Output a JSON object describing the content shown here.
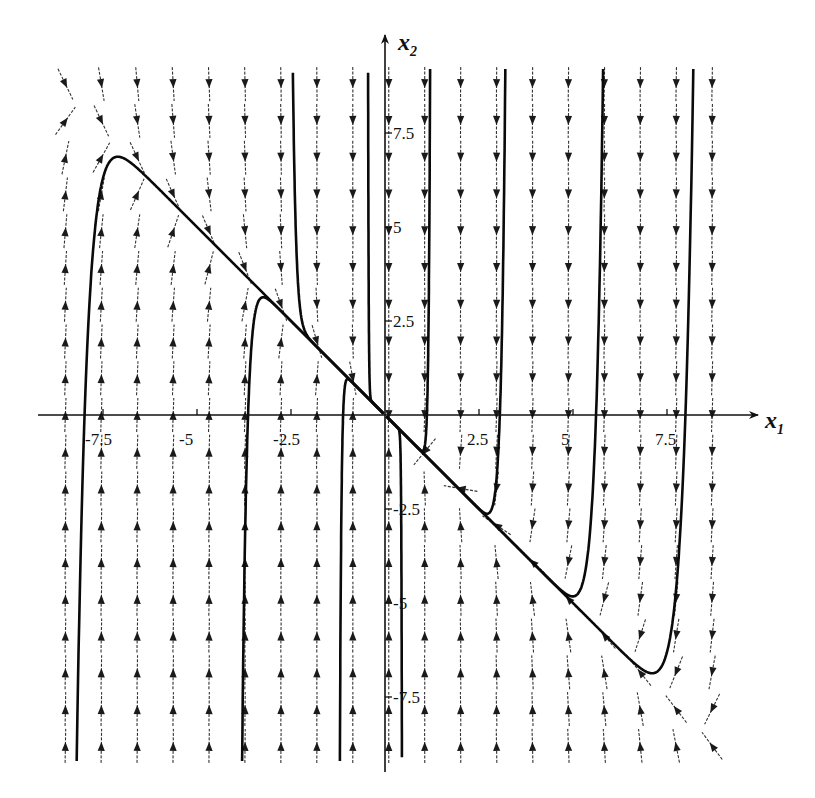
{
  "chart_data": {
    "type": "phase-portrait",
    "title": "",
    "system": {
      "description": "Linear stable node: x1' = l1*x1, x2' = -l1*x1 + l2*(x1 + x2)",
      "l1": -0.1,
      "l2": -3.0,
      "equilibrium": [
        0,
        0
      ],
      "slow_direction": [
        1,
        -1
      ],
      "fast_direction": [
        0,
        1
      ]
    },
    "xlabel": "x",
    "xlabel_sub": "1",
    "ylabel": "x",
    "ylabel_sub": "2",
    "xlim": [
      -9.2,
      9.6
    ],
    "ylim": [
      -9.5,
      10.2
    ],
    "xticks": [
      -7.5,
      -5,
      -2.5,
      2.5,
      5,
      7.5
    ],
    "xtick_labels": [
      "-7.5",
      "-5",
      "-2.5",
      "2.5",
      "5",
      "7.5"
    ],
    "yticks": [
      7.5,
      5,
      2.5,
      -2.5,
      -5,
      -7.5
    ],
    "ytick_labels": [
      "7.5",
      "5",
      "2.5",
      "-2.5",
      "-5",
      "-7.5"
    ],
    "direction_field": {
      "x1_range": [
        -8.5,
        8.7
      ],
      "x2_range": [
        -8.8,
        8.8
      ],
      "cols": 19,
      "rows": 19
    },
    "trajectories": [
      {
        "name": "traj-1",
        "start": [
          -8.2,
          -9.2
        ]
      },
      {
        "name": "traj-2",
        "start": [
          -3.8,
          -9.2
        ]
      },
      {
        "name": "traj-3",
        "start": [
          -1.2,
          -9.2
        ]
      },
      {
        "name": "traj-4",
        "start": [
          -2.45,
          9.1
        ]
      },
      {
        "name": "traj-5",
        "start": [
          -0.45,
          9.1
        ]
      },
      {
        "name": "traj-6",
        "start": [
          8.2,
          9.2
        ]
      },
      {
        "name": "traj-7",
        "start": [
          5.8,
          9.2
        ]
      },
      {
        "name": "traj-8",
        "start": [
          3.2,
          9.2
        ]
      },
      {
        "name": "traj-9",
        "start": [
          1.2,
          9.2
        ]
      },
      {
        "name": "traj-10",
        "start": [
          0.45,
          -9.1
        ]
      }
    ],
    "grid": false,
    "legend": "none"
  }
}
